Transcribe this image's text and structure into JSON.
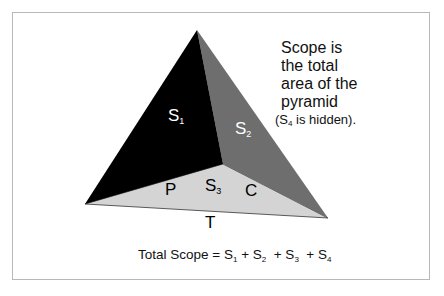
{
  "diagram": {
    "faces": [
      {
        "id": "S1",
        "label": "S",
        "sub": "1",
        "color": "#000000"
      },
      {
        "id": "S2",
        "label": "S",
        "sub": "2",
        "color": "#6e6e6e"
      },
      {
        "id": "S3",
        "label": "S",
        "sub": "3",
        "color": "#d4d4d4"
      }
    ],
    "edge_labels": {
      "p": "P",
      "c": "C",
      "t": "T"
    },
    "note": {
      "line1": "Scope is",
      "line2": "the total",
      "line3": "area of the",
      "line4": "pyramid",
      "hidden_prefix": "(S",
      "hidden_sub": "4",
      "hidden_suffix": " is hidden)."
    },
    "formula": {
      "prefix": "Total Scope = S",
      "t1_sub": "1",
      "plus2": " + S",
      "t2_sub": "2",
      "plus3": "  + S",
      "t3_sub": "3",
      "plus4": "  + S",
      "t4_sub": "4"
    }
  }
}
